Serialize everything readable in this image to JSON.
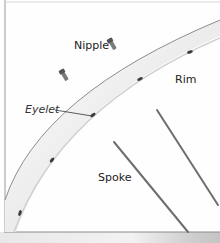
{
  "diagram": {
    "labels": {
      "nipple": "Nipple",
      "rim": "Rim",
      "eyelet": "Eyelet",
      "spoke": "Spoke"
    },
    "parts": [
      {
        "name": "nipple",
        "count": 2
      },
      {
        "name": "rim",
        "count": 1
      },
      {
        "name": "eyelet",
        "count": 5
      },
      {
        "name": "spoke",
        "count": 2
      }
    ],
    "colors": {
      "background": "#fefefe",
      "frame": "#9a9a9a",
      "rim_fill": "#f2f2f2",
      "rim_edge": "#8c8c8c",
      "spoke": "#6e6e6e",
      "eyelet": "#3a3a3a",
      "bottom_strip": "#cfcfcf"
    }
  }
}
